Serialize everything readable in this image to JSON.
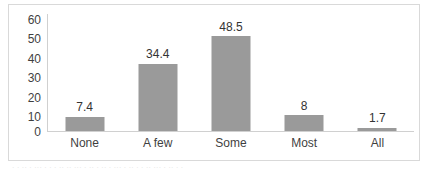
{
  "chart_data": {
    "type": "bar",
    "title": "",
    "subtitle": "",
    "xlabel": "",
    "ylabel": "",
    "categories": [
      "None",
      "A few",
      "Some",
      "Most",
      "All"
    ],
    "values": [
      7.4,
      34.4,
      48.5,
      8,
      1.7
    ],
    "data_labels": [
      "7.4",
      "34.4",
      "48.5",
      "8",
      "1.7"
    ],
    "ylim": [
      0,
      60
    ],
    "y_ticks": [
      60,
      50,
      40,
      30,
      20,
      10,
      0
    ],
    "y_tick_labels": [
      "60",
      "50",
      "40",
      "30",
      "20",
      "10",
      "0"
    ],
    "grid": false,
    "legend": false,
    "legend_position": "none",
    "series": [
      {
        "name": "",
        "values": [
          7.4,
          34.4,
          48.5,
          8,
          1.7
        ],
        "color": "#9a9a9a"
      }
    ]
  },
  "colors": {
    "bar": "#9a9a9a",
    "axis_line": "#d0d0d0",
    "frame_border": "#d9d9d9",
    "tick_text": "#3f3f3f",
    "label_text": "#333333",
    "background": "#ffffff"
  },
  "footer": {
    "bleed_text": "· · ·· · ··· · · · ·· ·· ··· · ·· · ·· · ··· · ·· · · ·· ··· · ·· · ·"
  }
}
